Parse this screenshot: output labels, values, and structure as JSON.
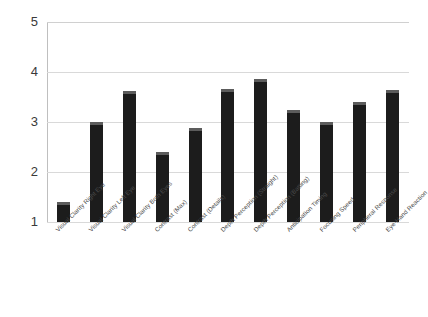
{
  "chart_data": {
    "type": "bar",
    "title": "",
    "xlabel": "",
    "ylabel": "",
    "ylim": [
      1,
      5
    ],
    "yticks": [
      "1",
      "2",
      "3",
      "4",
      "5"
    ],
    "grid": true,
    "legend": "none",
    "orientation": "vertical",
    "bar_color": "#1c1c1c",
    "bar_top_color": "#5c5c5c",
    "gridline_color": "#d9d9d9",
    "categories": [
      "Visual Clarity Right Eye",
      "Visual Clarity Left Eye",
      "Visual Clarity Both Eyes",
      "Contrast (Max)",
      "Contrast (Details)",
      "Depth Perception (Straight)",
      "Depth Perception (Batting)",
      "Anticipation Timing",
      "Focusing Speed",
      "Peripheral Response",
      "Eye-Hand Reaction"
    ],
    "values": [
      1.4,
      3.0,
      3.62,
      2.4,
      2.88,
      3.66,
      3.86,
      3.24,
      3.0,
      3.4,
      3.64
    ]
  }
}
